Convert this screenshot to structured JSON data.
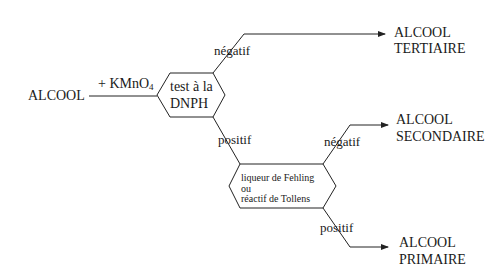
{
  "diagram": {
    "start": "ALCOOL",
    "reagent": "+ KMnO",
    "reagent_subscript": "4",
    "test1": {
      "line1": "test à la",
      "line2": "DNPH"
    },
    "test2": {
      "line1": "liqueur de Fehling",
      "line2": "ou",
      "line3": "réactif de Tollens"
    },
    "branches": {
      "test1_negative": "négatif",
      "test1_positive": "positif",
      "test2_negative": "négatif",
      "test2_positive": "positif"
    },
    "results": {
      "tertiary": {
        "line1": "ALCOOL",
        "line2": "TERTIAIRE"
      },
      "secondary": {
        "line1": "ALCOOL",
        "line2": "SECONDAIRE"
      },
      "primary": {
        "line1": "ALCOOL",
        "line2": "PRIMAIRE"
      }
    },
    "colors": {
      "line": "#222222",
      "background": "#ffffff"
    }
  }
}
